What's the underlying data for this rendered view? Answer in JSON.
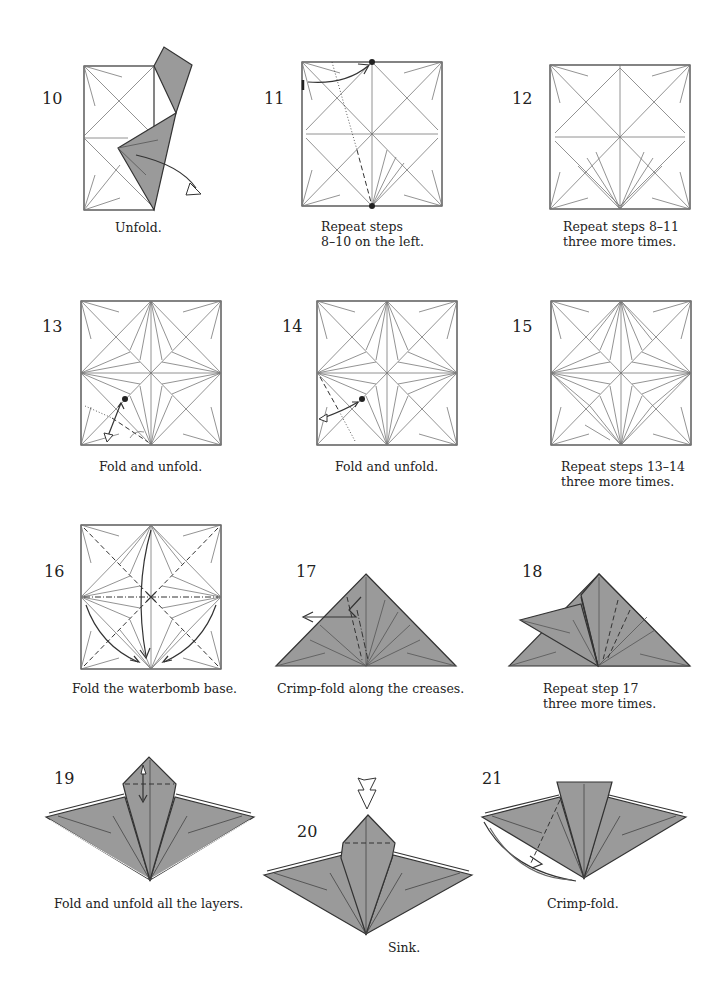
{
  "steps": [
    {
      "number": "10",
      "caption": "Unfold."
    },
    {
      "number": "11",
      "caption": "Repeat steps\n8–10 on the left."
    },
    {
      "number": "12",
      "caption": "Repeat steps 8–11\nthree more times."
    },
    {
      "number": "13",
      "caption": "Fold and unfold."
    },
    {
      "number": "14",
      "caption": "Fold and unfold."
    },
    {
      "number": "15",
      "caption": "Repeat steps 13–14\nthree more times."
    },
    {
      "number": "16",
      "caption": "Fold the waterbomb base."
    },
    {
      "number": "17",
      "caption": "Crimp-fold along the creases."
    },
    {
      "number": "18",
      "caption": "Repeat step 17\nthree more times."
    },
    {
      "number": "19",
      "caption": "Fold and unfold all the layers."
    },
    {
      "number": "20",
      "caption": "Sink."
    },
    {
      "number": "21",
      "caption": "Crimp-fold."
    }
  ],
  "colors": {
    "paper_color": "#9a9a9a",
    "line_color": "#333333",
    "crease_color": "#777777"
  }
}
